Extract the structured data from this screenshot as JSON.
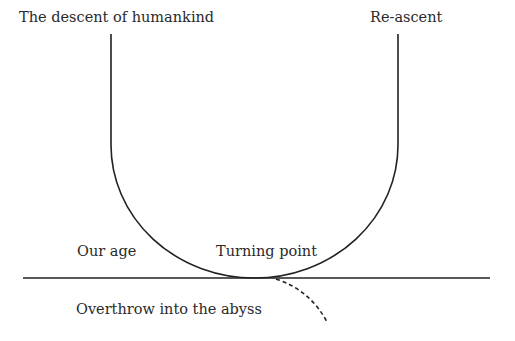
{
  "diagram": {
    "labels": {
      "descent": "The descent of humankind",
      "reascent": "Re-ascent",
      "our_age": "Our age",
      "turning_point": "Turning point",
      "abyss": "Overthrow into the abyss"
    },
    "colors": {
      "line": "#222222",
      "text": "#2a2a2a",
      "background": "#ffffff"
    }
  }
}
